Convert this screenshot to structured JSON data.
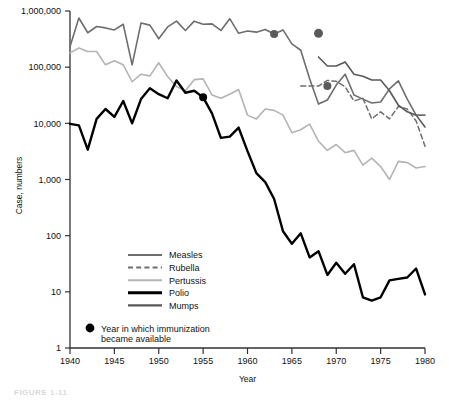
{
  "figure": {
    "caption": "FIGURE 1-11"
  },
  "chart_data": {
    "type": "line",
    "title": "",
    "xlabel": "Year",
    "ylabel": "Case, numbers",
    "yscale": "log",
    "ylim": [
      1,
      1000000
    ],
    "xlim": [
      1940,
      1980
    ],
    "grid": false,
    "legend_position": "inside-lower-left",
    "ytick_labels": [
      "1,000,000",
      "100,000",
      "10,000",
      "1,000",
      "100",
      "10",
      "1"
    ],
    "ytick_values": [
      1000000,
      100000,
      10000,
      1000,
      100,
      10,
      1
    ],
    "xtick_labels": [
      "1940",
      "1945",
      "1950",
      "1955",
      "1960",
      "1965",
      "1970",
      "1975",
      "1980"
    ],
    "xtick_values": [
      1940,
      1945,
      1950,
      1955,
      1960,
      1965,
      1970,
      1975,
      1980
    ],
    "colors": {
      "measles": "#6e6e6e",
      "rubella": "#6e6e6e",
      "pertussis": "#b4b4b4",
      "polio": "#000000",
      "mumps": "#595959",
      "marker": "#5a5a5a",
      "marker_polio": "#000000",
      "axis": "#333333"
    },
    "series": [
      {
        "name": "Measles",
        "key": "measles",
        "style": "solid",
        "color": "#6e6e6e",
        "width": 1.6,
        "x": [
          1940,
          1941,
          1942,
          1943,
          1944,
          1945,
          1946,
          1947,
          1948,
          1949,
          1950,
          1951,
          1952,
          1953,
          1954,
          1955,
          1956,
          1957,
          1958,
          1959,
          1960,
          1961,
          1962,
          1963,
          1964,
          1965,
          1966,
          1967,
          1968,
          1969,
          1970,
          1971,
          1972,
          1973,
          1974,
          1975,
          1976,
          1977,
          1978,
          1979,
          1980
        ],
        "y": [
          230000,
          750000,
          410000,
          530000,
          500000,
          460000,
          580000,
          110000,
          610000,
          560000,
          320000,
          520000,
          660000,
          450000,
          660000,
          580000,
          590000,
          450000,
          730000,
          400000,
          440000,
          420000,
          470000,
          390000,
          460000,
          260000,
          200000,
          62000,
          22000,
          26000,
          48000,
          75000,
          32000,
          27000,
          23000,
          24000,
          41000,
          57000,
          27000,
          14000,
          14000
        ]
      },
      {
        "name": "Rubella",
        "key": "rubella",
        "style": "dashed",
        "color": "#6e6e6e",
        "width": 1.5,
        "x": [
          1966,
          1967,
          1968,
          1969,
          1970,
          1971,
          1972,
          1973,
          1974,
          1975,
          1976,
          1977,
          1978,
          1979,
          1980
        ],
        "y": [
          46000,
          46000,
          46000,
          58000,
          56000,
          45000,
          25000,
          28000,
          12000,
          16000,
          12000,
          20000,
          18000,
          11000,
          3900
        ]
      },
      {
        "name": "Pertussis",
        "key": "pertussis",
        "style": "solid",
        "color": "#b4b4b4",
        "width": 1.6,
        "x": [
          1940,
          1941,
          1942,
          1943,
          1944,
          1945,
          1946,
          1947,
          1948,
          1949,
          1950,
          1951,
          1952,
          1953,
          1954,
          1955,
          1956,
          1957,
          1958,
          1959,
          1960,
          1961,
          1962,
          1963,
          1964,
          1965,
          1966,
          1967,
          1968,
          1969,
          1970,
          1971,
          1972,
          1973,
          1974,
          1975,
          1976,
          1977,
          1978,
          1979,
          1980
        ],
        "y": [
          180000,
          220000,
          190000,
          190000,
          110000,
          130000,
          110000,
          55000,
          75000,
          70000,
          120000,
          68000,
          45000,
          38000,
          60000,
          62000,
          32000,
          28000,
          33000,
          40000,
          14000,
          12000,
          18000,
          17000,
          14000,
          6800,
          7700,
          9700,
          4800,
          3300,
          4200,
          3000,
          3300,
          1800,
          2400,
          1700,
          1000,
          2100,
          2000,
          1600,
          1700
        ]
      },
      {
        "name": "Polio",
        "key": "polio",
        "style": "solid",
        "color": "#000000",
        "width": 2.4,
        "x": [
          1940,
          1941,
          1942,
          1943,
          1944,
          1945,
          1946,
          1947,
          1948,
          1949,
          1950,
          1951,
          1952,
          1953,
          1954,
          1955,
          1956,
          1957,
          1958,
          1959,
          1960,
          1961,
          1962,
          1963,
          1964,
          1965,
          1966,
          1967,
          1968,
          1969,
          1970,
          1971,
          1972,
          1973,
          1974,
          1975,
          1976,
          1977,
          1978,
          1979,
          1980
        ],
        "y": [
          9800,
          9200,
          3400,
          12000,
          18000,
          13000,
          25000,
          10000,
          27000,
          42000,
          33000,
          28000,
          58000,
          35000,
          38000,
          29000,
          15000,
          5500,
          5800,
          8400,
          3200,
          1300,
          900,
          450,
          120,
          72,
          110,
          41,
          53,
          20,
          33,
          21,
          31,
          8,
          7,
          8,
          16,
          17,
          18,
          26,
          9
        ]
      },
      {
        "name": "Mumps",
        "key": "mumps",
        "style": "solid",
        "color": "#595959",
        "width": 1.6,
        "x": [
          1968,
          1969,
          1970,
          1971,
          1972,
          1973,
          1974,
          1975,
          1976,
          1977,
          1978,
          1979,
          1980
        ],
        "y": [
          152000,
          105000,
          105000,
          124000,
          75000,
          69000,
          59000,
          59000,
          38000,
          21000,
          16000,
          14000,
          8600
        ]
      }
    ],
    "markers": [
      {
        "label": "Polio immunization",
        "x": 1955,
        "y": 29000,
        "series": "polio",
        "color": "#000000",
        "r": 4
      },
      {
        "label": "Measles immunization",
        "x": 1963,
        "y": 390000,
        "series": "measles",
        "color": "#5a5a5a",
        "r": 4
      },
      {
        "label": "Mumps immunization",
        "x": 1968,
        "y": 400000,
        "series": "mumps",
        "color": "#5a5a5a",
        "r": 4.5
      },
      {
        "label": "Rubella immunization",
        "x": 1969,
        "y": 46000,
        "series": "rubella",
        "color": "#5a5a5a",
        "r": 4
      }
    ],
    "legend_items": [
      {
        "label": "Measles",
        "key": "measles",
        "style": "solid",
        "color": "#6e6e6e",
        "width": 2
      },
      {
        "label": "Rubella",
        "key": "rubella",
        "style": "dashed",
        "color": "#6e6e6e",
        "width": 2
      },
      {
        "label": "Pertussis",
        "key": "pertussis",
        "style": "solid",
        "color": "#b4b4b4",
        "width": 2
      },
      {
        "label": "Polio",
        "key": "polio",
        "style": "solid",
        "color": "#000000",
        "width": 3
      },
      {
        "label": "Mumps",
        "key": "mumps",
        "style": "solid",
        "color": "#595959",
        "width": 2.2
      }
    ],
    "marker_note": {
      "line1": "Year in which immunization",
      "line2": "became available"
    }
  }
}
